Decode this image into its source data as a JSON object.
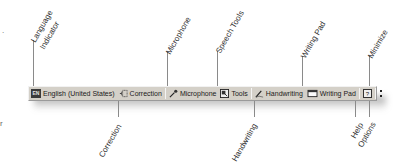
{
  "toolbar": {
    "language_code": "EN",
    "language": "English (United States)",
    "correction": "Correction",
    "microphone": "Microphone",
    "tools": "Tools",
    "handwriting": "Handwriting",
    "writing_pad": "Writing Pad",
    "help_glyph": "?",
    "colors": {
      "background": "#d4d0c8",
      "text": "#1a1a1a"
    }
  },
  "callouts": {
    "above": [
      {
        "line1": "Language",
        "line2": "Indicator"
      },
      {
        "line1": "Microphone"
      },
      {
        "line1": "Speech Tools"
      },
      {
        "line1": "Writing Pad"
      },
      {
        "line1": "Minimize"
      }
    ],
    "below": [
      {
        "line1": "Correction"
      },
      {
        "line1": "Handwriting"
      },
      {
        "line1": "Help"
      },
      {
        "line1": "Options"
      }
    ]
  },
  "stray": {
    "top_left": ".",
    "bottom_left": "r"
  }
}
